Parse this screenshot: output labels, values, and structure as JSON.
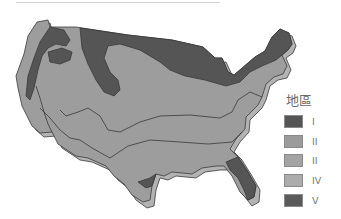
{
  "map": {
    "subject": "Continental United States zones",
    "colors": {
      "dark": "#555555",
      "light": "#9d9d9d",
      "shadow": "#b3b3b3",
      "outline": "#3a3a3a"
    }
  },
  "legend": {
    "title": "地區",
    "items": [
      {
        "label": "I",
        "color": "#555555"
      },
      {
        "label": "II",
        "color": "#9b9b9b"
      },
      {
        "label": "II",
        "color": "#a3a3a3"
      },
      {
        "label": "IV",
        "color": "#acacac"
      },
      {
        "label": "V",
        "color": "#5a5a5a"
      }
    ]
  }
}
